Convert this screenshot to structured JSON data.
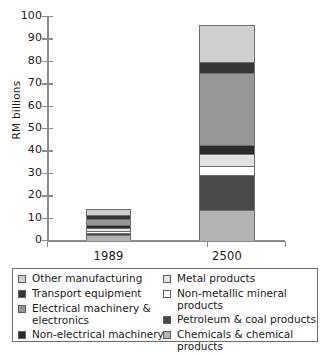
{
  "chart_data": {
    "type": "bar",
    "subtype": "stacked-vertical",
    "title": "",
    "xlabel": "",
    "ylabel": "RM billions",
    "ylim": [
      0,
      100
    ],
    "yticks": [
      0,
      10,
      20,
      30,
      40,
      50,
      60,
      70,
      80,
      90,
      100
    ],
    "ytick_labels": [
      "0",
      "10",
      "20",
      "30",
      "40",
      "50",
      "60",
      "70",
      "80",
      "90",
      "100"
    ],
    "grid": false,
    "legend_position": "below-plot",
    "categories": [
      "1989",
      "2500"
    ],
    "series": [
      {
        "name": "Chemicals & chemical products",
        "values": [
          2.5,
          14.0
        ],
        "color": "#b4b4b4"
      },
      {
        "name": "Petroleum & coal products",
        "values": [
          1.0,
          15.5
        ],
        "color": "#4a4a4a"
      },
      {
        "name": "Non-metallic mineral products",
        "values": [
          1.0,
          4.0
        ],
        "color": "#ffffff"
      },
      {
        "name": "Metal products",
        "values": [
          1.5,
          5.5
        ],
        "color": "#e2e2e2"
      },
      {
        "name": "Non-electrical machinery",
        "values": [
          1.0,
          4.0
        ],
        "color": "#2b2b2b"
      },
      {
        "name": "Electrical machinery & electronics",
        "values": [
          3.0,
          32.0
        ],
        "color": "#969696"
      },
      {
        "name": "Transport equipment",
        "values": [
          1.5,
          5.0
        ],
        "color": "#363636"
      },
      {
        "name": "Other manufacturing",
        "values": [
          2.5,
          16.0
        ],
        "color": "#cfcfcf"
      }
    ],
    "totals": [
      14.0,
      96.0
    ]
  },
  "axis": {
    "y_title": "RM billions",
    "y_labels": [
      "100",
      "90",
      "80",
      "70",
      "60",
      "50",
      "40",
      "30",
      "20",
      "10",
      "0"
    ],
    "x_labels": [
      "1989",
      "2500"
    ]
  },
  "legend": {
    "left_column": [
      {
        "label": "Other manufacturing",
        "color": "#cfcfcf"
      },
      {
        "label": "Transport equipment",
        "color": "#363636"
      },
      {
        "label": "Electrical machinery &\nelectronics",
        "color": "#969696"
      },
      {
        "label": "Non-electrical machinery",
        "color": "#2b2b2b"
      }
    ],
    "right_column": [
      {
        "label": "Metal products",
        "color": "#e2e2e2"
      },
      {
        "label": "Non-metallic mineral products",
        "color": "#ffffff"
      },
      {
        "label": "Petroleum & coal products",
        "color": "#4a4a4a"
      },
      {
        "label": "Chemicals & chemical products",
        "color": "#b4b4b4"
      }
    ]
  },
  "colors": {
    "axis": "#8c8c8c",
    "outline": "#6f6f6f",
    "legend_border": "#6e6e6e",
    "text": "#1a1a1a",
    "background": "#ffffff"
  }
}
